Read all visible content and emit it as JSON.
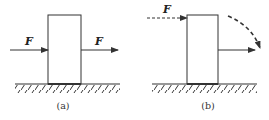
{
  "diagram": {
    "colors": {
      "stroke": "#333333",
      "background": "#ffffff"
    },
    "panels": [
      {
        "id": "a",
        "caption": "(a)",
        "block": {
          "x": 48,
          "y": 15,
          "width": 33,
          "height": 69
        },
        "ground": {
          "x1": 15,
          "x2": 120,
          "y": 84
        },
        "forces": [
          {
            "label": "F",
            "style": "solid",
            "x1": 10,
            "x2": 48,
            "y": 50,
            "label_x": 25,
            "label_y": 44
          },
          {
            "label": "F",
            "style": "solid",
            "x1": 81,
            "x2": 118,
            "y": 50,
            "label_x": 95,
            "label_y": 44
          }
        ]
      },
      {
        "id": "b",
        "caption": "(b)",
        "block": {
          "x": 187,
          "y": 15,
          "width": 31,
          "height": 69
        },
        "ground": {
          "x1": 152,
          "x2": 257,
          "y": 84
        },
        "forces": [
          {
            "label": "F",
            "style": "dashed",
            "x1": 147,
            "x2": 187,
            "y": 18,
            "label_x": 163,
            "label_y": 12
          },
          {
            "label": "",
            "style": "solid",
            "x1": 218,
            "x2": 255,
            "y": 50
          }
        ],
        "curved_arrow": {
          "style": "dashed",
          "from": [
            228,
            15
          ],
          "to": [
            260,
            48
          ]
        }
      }
    ]
  }
}
